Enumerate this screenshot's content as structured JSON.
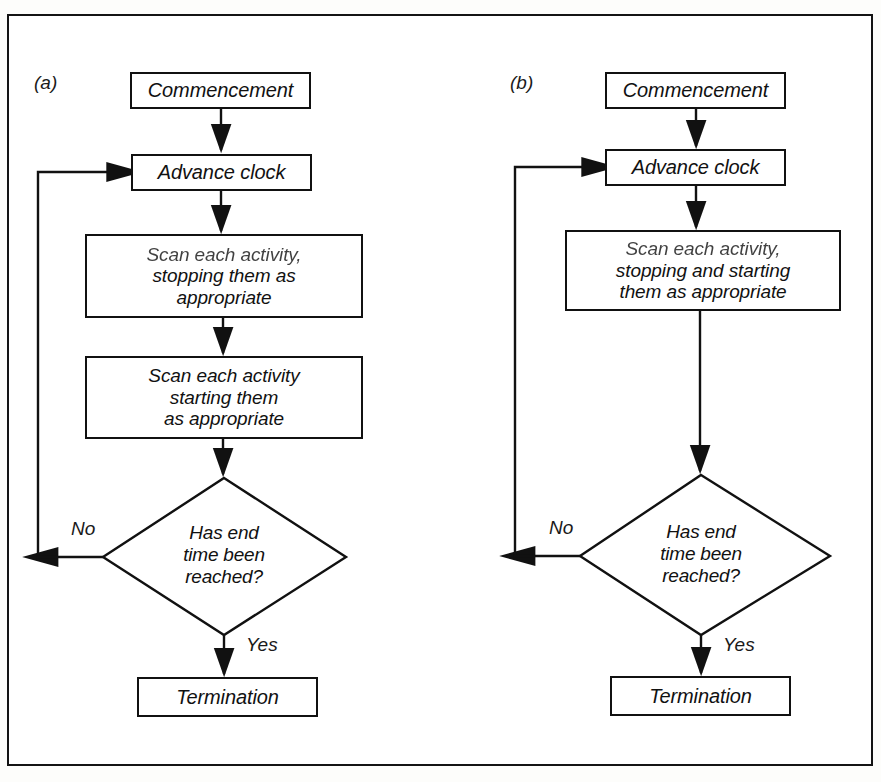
{
  "figure": {
    "background_color": "#ffffff",
    "line_color": "#111111",
    "frame": true
  },
  "panels": [
    {
      "id": "a",
      "label": "(a)",
      "nodes": {
        "start": {
          "type": "process",
          "label": "Commencement"
        },
        "advance_clock": {
          "type": "process",
          "label": "Advance clock"
        },
        "scan_stop": {
          "type": "process",
          "lines": [
            "Scan each activity,",
            "stopping them as",
            "appropriate"
          ]
        },
        "scan_start": {
          "type": "process",
          "lines": [
            "Scan each activity",
            "starting them",
            "as appropriate"
          ]
        },
        "decision": {
          "type": "decision",
          "lines": [
            "Has end",
            "time been",
            "reached?"
          ]
        },
        "end": {
          "type": "process",
          "label": "Termination"
        }
      },
      "edge_labels": {
        "no": "No",
        "yes": "Yes"
      }
    },
    {
      "id": "b",
      "label": "(b)",
      "nodes": {
        "start": {
          "type": "process",
          "label": "Commencement"
        },
        "advance_clock": {
          "type": "process",
          "label": "Advance clock"
        },
        "scan_stop_start": {
          "type": "process",
          "lines": [
            "Scan each activity,",
            "stopping and starting",
            "them as appropriate"
          ]
        },
        "decision": {
          "type": "decision",
          "lines": [
            "Has end",
            "time been",
            "reached?"
          ]
        },
        "end": {
          "type": "process",
          "label": "Termination"
        }
      },
      "edge_labels": {
        "no": "No",
        "yes": "Yes"
      }
    }
  ]
}
